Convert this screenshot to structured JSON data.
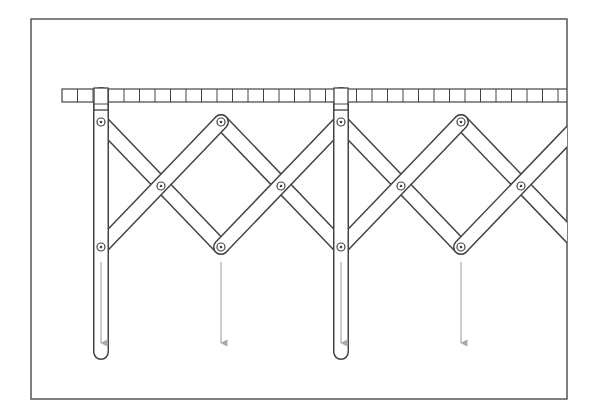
{
  "diagram": {
    "type": "scissor-linkage-mechanism",
    "colors": {
      "background": "#ffffff",
      "frame": "#555555",
      "line": "#444444",
      "arrow": "#aaaaaa",
      "pivot_fill": "#ffffff"
    },
    "frame": {
      "x": 31,
      "y": 19,
      "width": 536,
      "height": 380
    },
    "rail": {
      "x_start": 62,
      "x_end": 567,
      "y": 89,
      "height": 13,
      "cell_width": 15.5
    },
    "sliders": [
      {
        "x": 101,
        "label": ""
      },
      {
        "x": 341,
        "label": ""
      }
    ],
    "top_pivots": [
      [
        101,
        122
      ],
      [
        221,
        122
      ],
      [
        341,
        122
      ],
      [
        461,
        122
      ]
    ],
    "middle_pivots": [
      [
        161,
        186
      ],
      [
        281,
        186
      ],
      [
        401,
        186
      ],
      [
        521,
        186
      ]
    ],
    "bottom_pivots": [
      [
        101,
        247
      ],
      [
        221,
        247
      ],
      [
        341,
        247
      ],
      [
        461,
        247
      ]
    ],
    "hanging_rods": [
      {
        "x": 101,
        "y_top": 95,
        "y_bottom": 352
      },
      {
        "x": 341,
        "y_top": 95,
        "y_bottom": 352
      }
    ],
    "arrows": [
      {
        "x": 101,
        "y_start": 262,
        "y_end": 343
      },
      {
        "x": 221,
        "y_start": 262,
        "y_end": 343
      },
      {
        "x": 341,
        "y_start": 262,
        "y_end": 343
      },
      {
        "x": 461,
        "y_start": 262,
        "y_end": 343
      }
    ]
  }
}
